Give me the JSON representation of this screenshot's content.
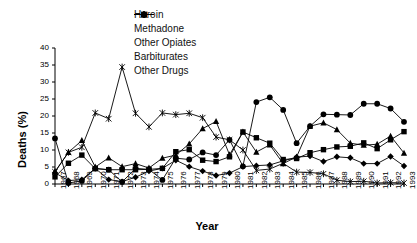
{
  "chart_data": {
    "type": "line",
    "title": "",
    "xlabel": "Year",
    "ylabel": "Deaths (%)",
    "ylim": [
      0,
      40
    ],
    "ytick_step": 5,
    "yticks": [
      "0",
      "5",
      "10",
      "15",
      "20",
      "25",
      "30",
      "35",
      "40"
    ],
    "grid": false,
    "legend_position": "top-center",
    "x": [
      1967,
      1968,
      1969,
      1970,
      1971,
      1972,
      1973,
      1974,
      1975,
      1976,
      1977,
      1978,
      1979,
      1980,
      1981,
      1982,
      1983,
      1984,
      1985,
      1986,
      1987,
      1988,
      1989,
      1990,
      1991,
      1992,
      1993
    ],
    "categories": [
      "1967",
      "1968",
      "1969",
      "1970",
      "1971",
      "1972",
      "1973",
      "1974",
      "1975",
      "1976",
      "1977",
      "1978",
      "1979",
      "1980",
      "1981",
      "1982",
      "1983",
      "1984",
      "1985",
      "1986",
      "1987",
      "1988",
      "1989",
      "1990",
      "1991",
      "1992",
      "1993"
    ],
    "series": [
      {
        "name": "Heroin",
        "marker": "diamond",
        "color": "#000000",
        "values": [
          3.3,
          1.0,
          1.3,
          4.6,
          1.3,
          0.7,
          2.0,
          3.8,
          4.6,
          7.0,
          5.1,
          3.8,
          2.5,
          3.2,
          5.1,
          5.4,
          5.6,
          6.8,
          7.9,
          8.2,
          6.6,
          8.0,
          7.7,
          6.0,
          6.0,
          8.1,
          5.3
        ]
      },
      {
        "name": "Methadone",
        "marker": "square",
        "color": "#000000",
        "values": [
          2.1,
          6.1,
          8.5,
          4.5,
          4.2,
          4.2,
          4.2,
          4.3,
          4.6,
          9.5,
          10.1,
          7.0,
          6.6,
          8.0,
          15.3,
          13.6,
          12.0,
          7.2,
          7.5,
          9.2,
          10.1,
          10.9,
          11.1,
          12.1,
          10.4,
          13.0,
          15.4
        ]
      },
      {
        "name": "Other Opiates",
        "marker": "triangle",
        "color": "#000000",
        "values": [
          3.6,
          9.3,
          12.8,
          5.0,
          7.7,
          5.1,
          6.0,
          4.7,
          7.6,
          8.5,
          11.8,
          16.3,
          18.4,
          8.6,
          15.3,
          9.4,
          11.5,
          6.0,
          8.0,
          17.0,
          18.0,
          16.0,
          12.0,
          11.4,
          11.7,
          14.1,
          9.1
        ]
      },
      {
        "name": "Barbiturates",
        "marker": "star",
        "color": "#000000",
        "values": [
          3.6,
          9.3,
          10.8,
          20.9,
          19.2,
          34.4,
          20.8,
          16.8,
          20.9,
          20.4,
          20.8,
          19.5,
          13.8,
          13.0,
          10.0,
          4.0,
          4.4,
          6.1,
          3.5,
          3.4,
          3.0,
          1.1,
          0.7,
          0.8,
          0.3,
          0.4,
          0.3
        ]
      },
      {
        "name": "Other Drugs",
        "marker": "circle",
        "color": "#000000",
        "values": [
          13.4,
          0.3,
          0.9,
          4.6,
          4.2,
          0.6,
          4.6,
          4.3,
          1.2,
          7.6,
          7.2,
          9.3,
          8.5,
          13.0,
          5.2,
          24.1,
          25.5,
          21.8,
          12.0,
          17.0,
          20.5,
          20.4,
          20.3,
          23.6,
          23.6,
          22.2,
          18.3
        ]
      }
    ]
  },
  "legend": {
    "items": [
      {
        "label": "Heroin",
        "marker": "diamond"
      },
      {
        "label": "Methadone",
        "marker": "square"
      },
      {
        "label": "Other Opiates",
        "marker": "triangle"
      },
      {
        "label": "Barbiturates",
        "marker": "star"
      },
      {
        "label": "Other Drugs",
        "marker": "circle"
      }
    ]
  },
  "axes": {
    "x_title": "Year",
    "y_title": "Deaths (%)"
  }
}
